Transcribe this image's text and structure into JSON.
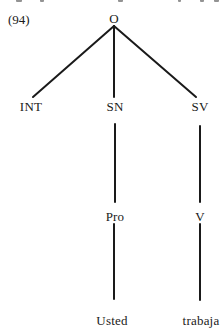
{
  "example": {
    "number": "(94)"
  },
  "tree": {
    "root": {
      "label": "O",
      "x": 114,
      "y": 12
    },
    "level1": [
      {
        "label": "INT",
        "x": 31,
        "y": 100
      },
      {
        "label": "SN",
        "x": 115,
        "y": 100
      },
      {
        "label": "SV",
        "x": 200,
        "y": 100
      }
    ],
    "level2": [
      {
        "label": "Pro",
        "x": 115,
        "y": 210
      },
      {
        "label": "V",
        "x": 200,
        "y": 210
      }
    ],
    "leaves": [
      {
        "label": "Usted",
        "x": 112,
        "y": 314
      },
      {
        "label": "trabaja",
        "x": 201,
        "y": 314
      }
    ],
    "edges": [
      {
        "from": "O",
        "to": "INT",
        "x1": 114,
        "y1": 26,
        "x2": 33,
        "y2": 97
      },
      {
        "from": "O",
        "to": "SN",
        "x1": 114,
        "y1": 26,
        "x2": 114,
        "y2": 97
      },
      {
        "from": "O",
        "to": "SV",
        "x1": 114,
        "y1": 26,
        "x2": 196,
        "y2": 97
      },
      {
        "from": "SN",
        "to": "Pro",
        "x1": 115,
        "y1": 124,
        "x2": 115,
        "y2": 202
      },
      {
        "from": "SV",
        "to": "V",
        "x1": 200,
        "y1": 126,
        "x2": 200,
        "y2": 202
      },
      {
        "from": "Pro",
        "to": "Usted",
        "x1": 114,
        "y1": 224,
        "x2": 114,
        "y2": 299
      },
      {
        "from": "V",
        "to": "trabaja",
        "x1": 200,
        "y1": 224,
        "x2": 200,
        "y2": 300
      }
    ],
    "line_color": "#1a1a1a"
  }
}
